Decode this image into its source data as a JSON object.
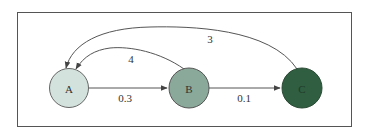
{
  "diagram": {
    "type": "directed-graph",
    "frame": {
      "border_color": "#555555",
      "background": "#ffffff"
    },
    "nodes": [
      {
        "id": "A",
        "label": "A",
        "fill": "#d3e2dc",
        "stroke": "#666666"
      },
      {
        "id": "B",
        "label": "B",
        "fill": "#8aa99a",
        "stroke": "#555555"
      },
      {
        "id": "C",
        "label": "C",
        "fill": "#2f5e40",
        "stroke": "#2a4a35"
      }
    ],
    "edges": [
      {
        "from": "A",
        "to": "B",
        "label": "0.3"
      },
      {
        "from": "B",
        "to": "C",
        "label": "0.1"
      },
      {
        "from": "B",
        "to": "A",
        "label": "4"
      },
      {
        "from": "C",
        "to": "A",
        "label": "3"
      }
    ]
  }
}
